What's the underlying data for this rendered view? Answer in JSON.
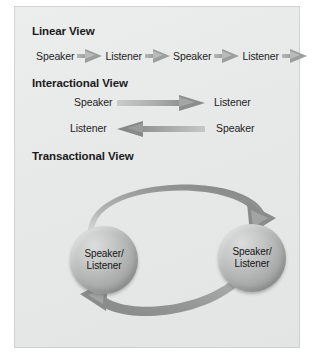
{
  "figure": {
    "panel_background": "#e7e8e8",
    "page_background": "#ffffff"
  },
  "sections": {
    "linear": {
      "heading": "Linear View",
      "sequence": [
        "Speaker",
        "Listener",
        "Speaker",
        "Listener"
      ],
      "arrow_count": 5,
      "arrow_icon": "arrow-right-icon",
      "arrow_color": "#9c9e9e"
    },
    "interactional": {
      "heading": "Interactional View",
      "rows": [
        {
          "source": "Speaker",
          "target": "Listener",
          "direction": "right",
          "arrow_icon": "arrow-right-icon"
        },
        {
          "source": "Speaker",
          "target": "Listener",
          "direction": "left",
          "arrow_icon": "arrow-left-icon"
        }
      ],
      "arrow_color": "#8c8e8e"
    },
    "transactional": {
      "heading": "Transactional View",
      "nodes": [
        {
          "line1": "Speaker/",
          "line2": "Listener"
        },
        {
          "line1": "Speaker/",
          "line2": "Listener"
        }
      ],
      "arrows": [
        {
          "icon": "curved-arrow-clockwise-icon",
          "from": "left-node",
          "to": "right-node",
          "position": "top"
        },
        {
          "icon": "curved-arrow-counterclockwise-icon",
          "from": "right-node",
          "to": "left-node",
          "position": "bottom"
        }
      ],
      "node_color": "#aaacac",
      "arrow_color": "#8e9090"
    }
  }
}
